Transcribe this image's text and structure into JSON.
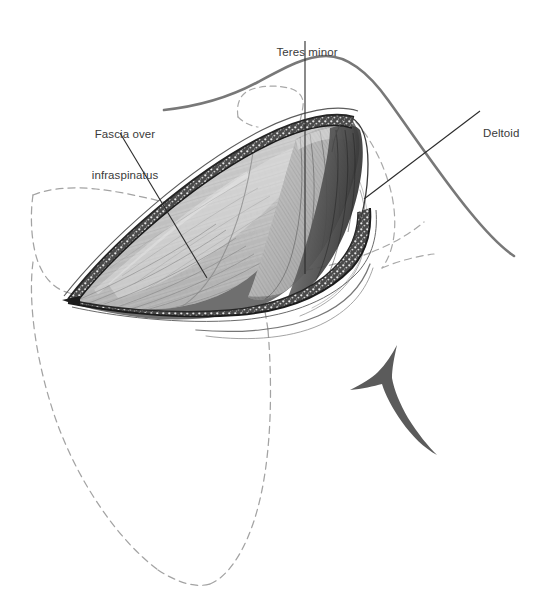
{
  "figure": {
    "kind": "surgical-anatomy-illustration",
    "background_color": "#ffffff",
    "ink_color": "#3a3a3a",
    "dashed_outline_color": "#9a9a9a",
    "text_color": "#3a3a3a"
  },
  "labels": [
    {
      "id": "fascia",
      "text": "Fascia over\ninfraspinatus",
      "line1": "Fascia over",
      "line2": "infraspinatus",
      "x": 125,
      "y": 108,
      "leader": {
        "x1": 120,
        "y1": 133,
        "x2": 207,
        "y2": 278
      }
    },
    {
      "id": "teres-minor",
      "text": "Teres minor",
      "line1": "Teres minor",
      "x": 307,
      "y": 26,
      "leader": {
        "x1": 305,
        "y1": 41,
        "x2": 305,
        "y2": 274
      }
    },
    {
      "id": "deltoid",
      "text": "Deltoid",
      "line1": "Deltoid",
      "x": 503,
      "y": 107,
      "leader": {
        "x1": 480,
        "y1": 111,
        "x2": 364,
        "y2": 199
      }
    }
  ],
  "structures": {
    "skin_contour": "solid gray curve sweeping across the upper field from left shoulder to right arm",
    "scapula_outline": "long dashed gray outline of the scapula occupying the left and lower field",
    "humerus_outline": "dashed gray outline of the proximal humerus at right",
    "acromion_outline": "small dashed gray outline above the wound",
    "wound": "elliptical opened surgical wound, lens-shaped, running upper-right to lower-left",
    "wound_edges": "stippled dark fascial / skin margins on both sides of the wound",
    "muscle_belly_left": "pale striated infraspinatus covered by glistening fascia",
    "muscle_belly_right": "darker teres minor fibers converging to the right",
    "deltoid_edge": "dark retracted deltoid muscle at the upper-right corner of the wound",
    "retractor_mark": "Y-shaped instrument / bony spine mark at lower right"
  }
}
